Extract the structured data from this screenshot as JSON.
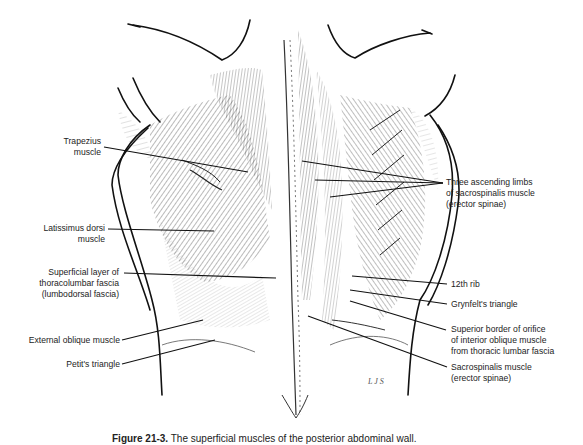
{
  "figure": {
    "caption_label": "Figure 21-3.",
    "caption_text": "The superficial muscles of the posterior abdominal wall.",
    "artist_signature": "LJS",
    "labels_left": [
      {
        "id": "trapezius",
        "lines": [
          "Trapezius",
          "muscle"
        ]
      },
      {
        "id": "latissimus-dorsi",
        "lines": [
          "Latissimus dorsi",
          "muscle"
        ]
      },
      {
        "id": "thoracolumbar-fascia",
        "lines": [
          "Superficial layer of",
          "thoracolumbar fascia",
          "(lumbodorsal fascia)"
        ]
      },
      {
        "id": "external-oblique",
        "lines": [
          "External oblique muscle"
        ]
      },
      {
        "id": "petits-triangle",
        "lines": [
          "Petit's triangle"
        ]
      }
    ],
    "labels_right": [
      {
        "id": "ascending-limbs",
        "lines": [
          "Three ascending limbs",
          "of sacrospinalis muscle",
          "(erector spinae)"
        ]
      },
      {
        "id": "twelfth-rib",
        "lines": [
          "12th rib"
        ]
      },
      {
        "id": "grynfelts-triangle",
        "lines": [
          "Grynfelt's triangle"
        ]
      },
      {
        "id": "superior-border-orifice",
        "lines": [
          "Superior border of orifice",
          "of interior oblique muscle",
          "from thoracic lumbar fascia"
        ]
      },
      {
        "id": "sacrospinalis",
        "lines": [
          "Sacrospinalis muscle",
          "(erector spinae)"
        ]
      }
    ]
  }
}
